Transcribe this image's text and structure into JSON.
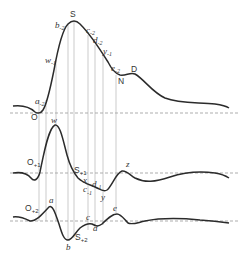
{
  "diagram": {
    "type": "waveform-derivatives",
    "colors": {
      "curve": "#2b2b2b",
      "baseline": "#8a8a8a",
      "guide": "#a8a8a8"
    },
    "traces": [
      {
        "id": "original",
        "labels": {
          "O": "O",
          "a_m2": "a",
          "a_m2_sub": "-2",
          "w_m1": "w",
          "w_m1_sub": "-1",
          "b_m2": "b",
          "b_m2_sub": "-2",
          "S": "S",
          "c_m2": "c",
          "c_m2_sub": "-2",
          "d_m2": "d",
          "d_m2_sub": "-2",
          "y_m1": "y",
          "y_m1_sub": "-1",
          "e_m2": "e",
          "e_m2_sub": "-2",
          "N": "N",
          "D": "D"
        }
      },
      {
        "id": "first-derivative",
        "labels": {
          "O": "O",
          "O_sub": "+1",
          "w": "w",
          "S": "S",
          "S_sub": "+1",
          "x": "x",
          "c": "c",
          "c_sub": "-1",
          "d": "d",
          "d_sub": "-1",
          "y": "y",
          "z": "z"
        }
      },
      {
        "id": "second-derivative",
        "labels": {
          "O": "O",
          "O_sub": "+2",
          "a": "a",
          "b": "b",
          "S": "S",
          "S_sub": "+2",
          "c": "c",
          "d": "d",
          "e": "e"
        }
      }
    ]
  }
}
